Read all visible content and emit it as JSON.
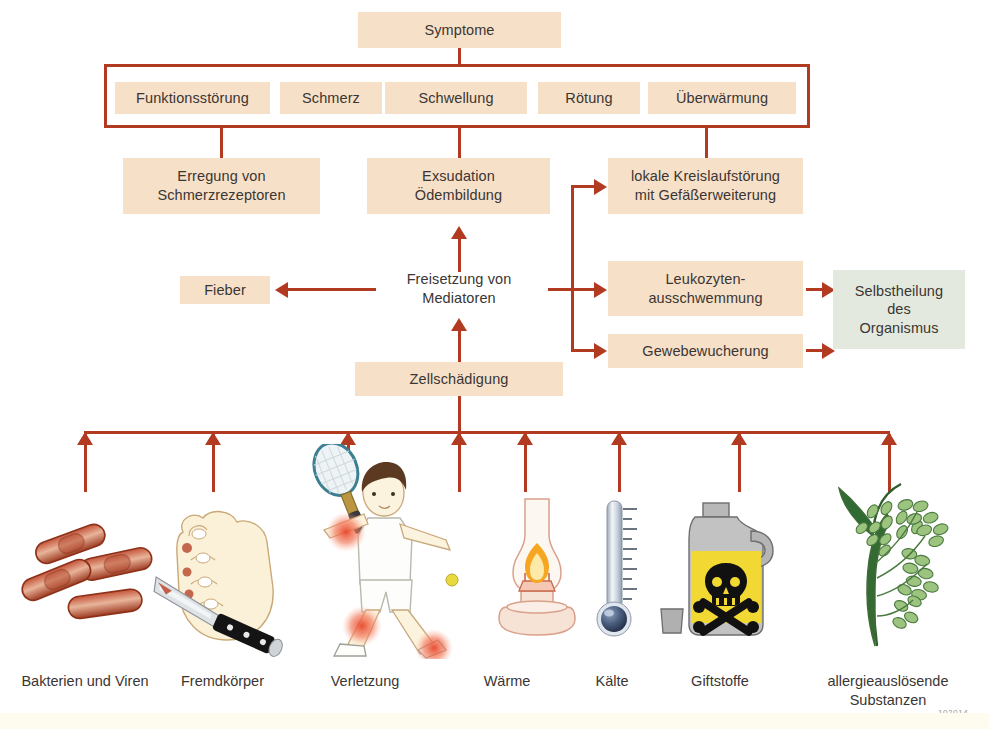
{
  "diagram": {
    "title": "Symptome",
    "credit": "102014",
    "colors": {
      "box_fill": "#f7e0c8",
      "box_fill_green": "#e3e9de",
      "connector": "#b23a20",
      "text": "#3a3633"
    },
    "symptom_boxes": [
      {
        "label": "Funktionsstörung"
      },
      {
        "label": "Schmerz"
      },
      {
        "label": "Schwellung"
      },
      {
        "label": "Rötung"
      },
      {
        "label": "Überwärmung"
      }
    ],
    "mechanism_boxes": [
      {
        "label": "Erregung von\nSchmerzrezeptoren"
      },
      {
        "label": "Exsudation\nÖdembildung"
      },
      {
        "label": "lokale Kreislaufstörung\nmit Gefäßerweiterung"
      },
      {
        "label": "Fieber"
      },
      {
        "label": "Freisetzung von\nMediatoren"
      },
      {
        "label": "Leukozyten-\nausschwemmung"
      },
      {
        "label": "Gewebewucherung"
      },
      {
        "label": "Selbstheilung\ndes\nOrganismus"
      },
      {
        "label": "Zellschädigung"
      }
    ],
    "causes": [
      {
        "label": "Bakterien und Viren",
        "icon": "bacteria-icon"
      },
      {
        "label": "Fremdkörper",
        "icon": "hand-knife-icon"
      },
      {
        "label": "Verletzung",
        "icon": "tennis-player-icon"
      },
      {
        "label": "Wärme",
        "icon": "oil-lamp-icon"
      },
      {
        "label": "Kälte",
        "icon": "thermometer-icon"
      },
      {
        "label": "Giftstoffe",
        "icon": "poison-jug-icon"
      },
      {
        "label": "allergieauslösende\nSubstanzen",
        "icon": "grass-pollen-icon"
      }
    ]
  }
}
